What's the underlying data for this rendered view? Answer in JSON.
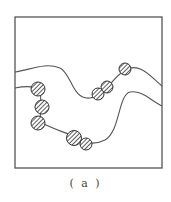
{
  "figure": {
    "caption": "( a )",
    "frame": {
      "x": 15,
      "y": 17,
      "w": 147,
      "h": 151
    },
    "colors": {
      "line": "#555555",
      "fill": "#444444",
      "background": "#ffffff"
    },
    "curves": [
      {
        "name": "upper-curve",
        "d": "M15,72 C30,70 45,62 60,68 C72,74 72,100 90,98 C105,96 110,80 125,70 C140,62 150,76 162,86"
      },
      {
        "name": "lower-curve",
        "d": "M15,88 C25,86 35,86 40,90 C42,105 40,115 40,122 C55,130 65,132 75,137 C85,144 95,145 105,140 C120,132 118,95 130,92 C142,90 150,100 162,106"
      }
    ],
    "particles": [
      {
        "cx": 38,
        "cy": 89,
        "r": 7
      },
      {
        "cx": 42,
        "cy": 107,
        "r": 7
      },
      {
        "cx": 38,
        "cy": 123,
        "r": 7
      },
      {
        "cx": 74,
        "cy": 138,
        "r": 7.5
      },
      {
        "cx": 86,
        "cy": 144,
        "r": 6
      },
      {
        "cx": 98,
        "cy": 94,
        "r": 6
      },
      {
        "cx": 107,
        "cy": 87,
        "r": 6
      },
      {
        "cx": 125,
        "cy": 69,
        "r": 6
      }
    ]
  }
}
